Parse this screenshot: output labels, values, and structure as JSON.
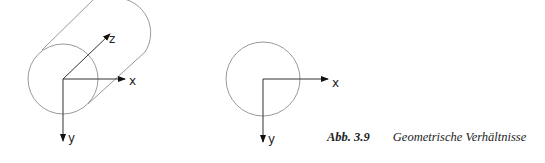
{
  "figure": {
    "left_diagram": {
      "axis_labels": {
        "z": "z",
        "x": "x",
        "y": "y"
      }
    },
    "right_diagram": {
      "axis_labels": {
        "x": "x",
        "y": "y"
      }
    },
    "caption": {
      "number": "Abb. 3.9",
      "text": "Geometrische Verhältnisse"
    }
  }
}
